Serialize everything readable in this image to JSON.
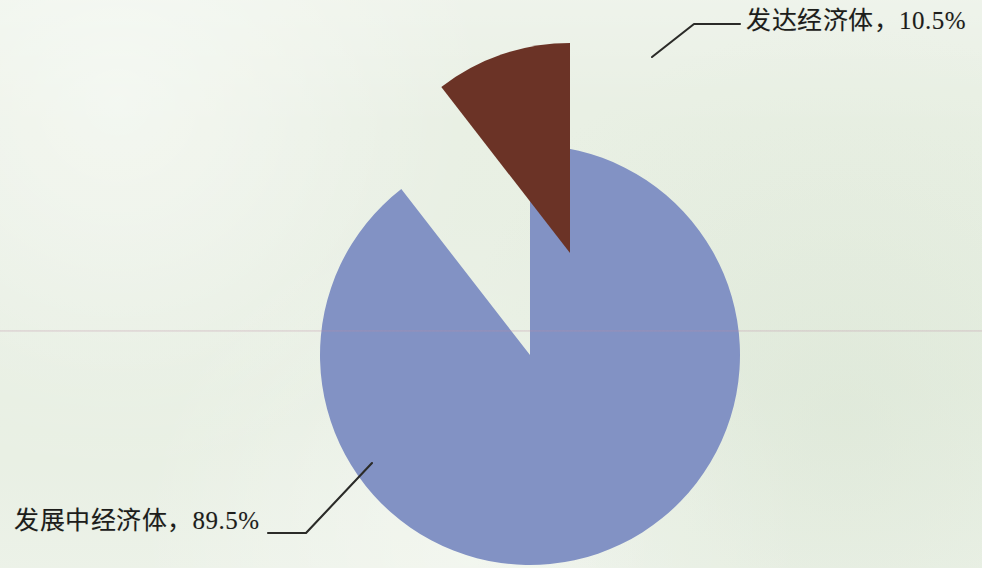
{
  "figure": {
    "background_color": "#E9F0E4",
    "width": 982,
    "height": 568
  },
  "chart_data": {
    "type": "pie",
    "title": "",
    "subtitle": "",
    "xlabel": "",
    "ylabel": "",
    "grid": false,
    "legend_position": "none",
    "labels_position": "outside-with-leader-lines",
    "start_angle_deg": 0,
    "direction": "clockwise",
    "center": {
      "x": 530,
      "y": 355
    },
    "radius": 210,
    "categories": [
      "发达经济体",
      "发展中经济体"
    ],
    "values": [
      10.5,
      89.5
    ],
    "value_unit": "%",
    "slices": [
      {
        "name": "发达经济体",
        "value": 10.5,
        "value_text": "10.5%",
        "label_text": "发达经济体，10.5%",
        "color": "#6B3326",
        "exploded": true,
        "explode_offset": {
          "x": 40,
          "y": -102
        },
        "start_angle_deg": 322.2,
        "end_angle_deg": 360.0
      },
      {
        "name": "发展中经济体",
        "value": 89.5,
        "value_text": "89.5%",
        "label_text": "发展中经济体，89.5%",
        "color": "#8292C4",
        "exploded": false,
        "explode_offset": {
          "x": 0,
          "y": 0
        },
        "start_angle_deg": 0.0,
        "end_angle_deg": 322.2
      }
    ]
  },
  "labels": {
    "developed": "发达经济体，10.5%",
    "developing": "发展中经济体，89.5%"
  },
  "colors": {
    "developed_slice": "#6B3326",
    "developing_slice": "#8292C4",
    "background": "#E9F0E4",
    "leader_line": "#2B2B28",
    "text": "#1D1D1B"
  }
}
